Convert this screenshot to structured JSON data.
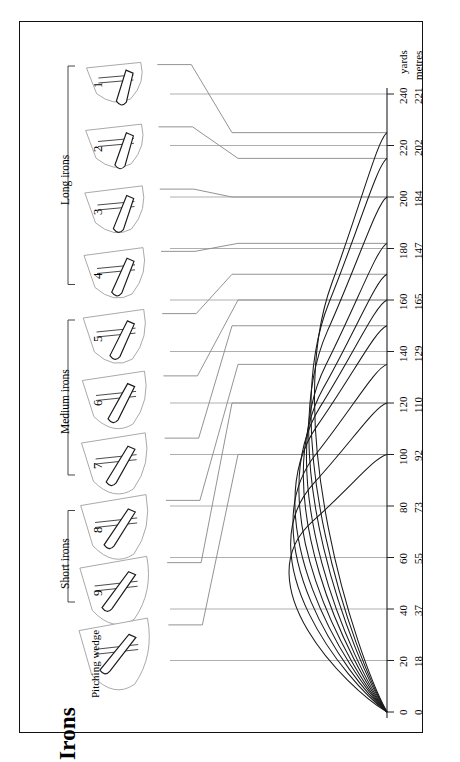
{
  "title": "Irons",
  "groups": [
    {
      "id": "long-irons",
      "label": "Long irons",
      "members": [
        "1",
        "2",
        "3",
        "4"
      ]
    },
    {
      "id": "medium-irons",
      "label": "Medium irons",
      "members": [
        "5",
        "6",
        "7"
      ]
    },
    {
      "id": "short-irons",
      "label": "Short irons",
      "members": [
        "8",
        "9"
      ]
    },
    {
      "id": "pitching",
      "label": "Pitching wedge",
      "members": [
        "PW"
      ]
    }
  ],
  "clubs": [
    {
      "id": "iron-1",
      "label": "1",
      "carry_yards": 225,
      "apex": 0.52
    },
    {
      "id": "iron-2",
      "label": "2",
      "carry_yards": 215,
      "apex": 0.56
    },
    {
      "id": "iron-3",
      "label": "3",
      "carry_yards": 200,
      "apex": 0.6
    },
    {
      "id": "iron-4",
      "label": "4",
      "carry_yards": 182,
      "apex": 0.65
    },
    {
      "id": "iron-5",
      "label": "5",
      "carry_yards": 170,
      "apex": 0.7
    },
    {
      "id": "iron-6",
      "label": "6",
      "carry_yards": 160,
      "apex": 0.76
    },
    {
      "id": "iron-7",
      "label": "7",
      "carry_yards": 150,
      "apex": 0.82
    },
    {
      "id": "iron-8",
      "label": "8",
      "carry_yards": 135,
      "apex": 0.88
    },
    {
      "id": "iron-9",
      "label": "9",
      "carry_yards": 120,
      "apex": 0.95
    },
    {
      "id": "iron-pw",
      "label": "Pitching wedge",
      "carry_yards": 100,
      "apex": 1.04
    }
  ],
  "axis": {
    "yards_caption": "yards",
    "metres_caption": "metres",
    "ticks": [
      {
        "yards": "0",
        "metres": "0"
      },
      {
        "yards": "20",
        "metres": "18"
      },
      {
        "yards": "40",
        "metres": "37"
      },
      {
        "yards": "60",
        "metres": "55"
      },
      {
        "yards": "80",
        "metres": "73"
      },
      {
        "yards": "100",
        "metres": "92"
      },
      {
        "yards": "120",
        "metres": "110"
      },
      {
        "yards": "140",
        "metres": "129"
      },
      {
        "yards": "160",
        "metres": "165"
      },
      {
        "yards": "180",
        "metres": "147"
      },
      {
        "yards": "200",
        "metres": "184"
      },
      {
        "yards": "220",
        "metres": "202"
      },
      {
        "yards": "240",
        "metres": "221"
      }
    ],
    "max_yards": 240
  },
  "chart_data": {
    "type": "line",
    "title": "Irons",
    "xlabel": "",
    "ylabel": "yards",
    "xlim": [
      0,
      240
    ],
    "grid": true,
    "legend": "none",
    "categories": [
      "1",
      "2",
      "3",
      "4",
      "5",
      "6",
      "7",
      "8",
      "9",
      "Pitching wedge"
    ],
    "series": [
      {
        "name": "1",
        "carry_yards": 225,
        "carry_metres": 206
      },
      {
        "name": "2",
        "carry_yards": 215,
        "carry_metres": 197
      },
      {
        "name": "3",
        "carry_yards": 200,
        "carry_metres": 184
      },
      {
        "name": "4",
        "carry_yards": 182,
        "carry_metres": 167
      },
      {
        "name": "5",
        "carry_yards": 170,
        "carry_metres": 156
      },
      {
        "name": "6",
        "carry_yards": 160,
        "carry_metres": 146
      },
      {
        "name": "7",
        "carry_yards": 150,
        "carry_metres": 137
      },
      {
        "name": "8",
        "carry_yards": 135,
        "carry_metres": 123
      },
      {
        "name": "9",
        "carry_yards": 120,
        "carry_metres": 110
      },
      {
        "name": "Pitching wedge",
        "carry_yards": 100,
        "carry_metres": 92
      }
    ],
    "tick_labels_yards": [
      "0",
      "20",
      "40",
      "60",
      "80",
      "100",
      "120",
      "140",
      "160",
      "180",
      "200",
      "220",
      "240"
    ],
    "tick_labels_metres": [
      "0",
      "18",
      "37",
      "55",
      "73",
      "92",
      "110",
      "129",
      "165",
      "147",
      "184",
      "202",
      "221"
    ]
  },
  "colors": {
    "ink": "#1a1a1a",
    "grid": "#8d8d8d",
    "hair": "#6f6f6f",
    "paper": "#ffffff"
  }
}
